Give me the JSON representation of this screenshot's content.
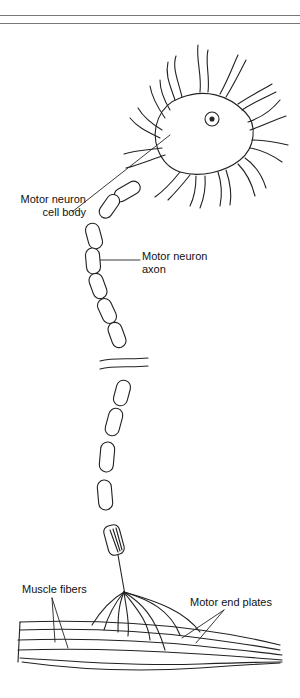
{
  "figure": {
    "labels": {
      "cell_body_line1": "Motor neuron",
      "cell_body_line2": "cell body",
      "axon_line1": "Motor neuron",
      "axon_line2": "axon",
      "muscle_fibers": "Muscle fibers",
      "end_plates": "Motor end plates"
    }
  }
}
